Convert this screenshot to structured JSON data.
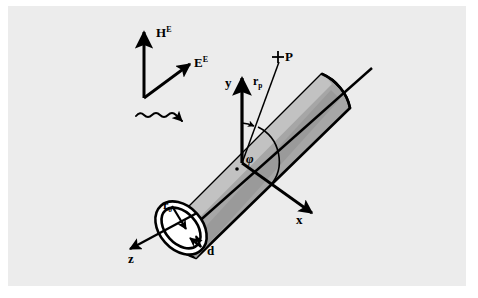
{
  "figure": {
    "background_color": "#ececec",
    "page_color": "#ffffff",
    "ink_color": "#000000",
    "cylinder_fill": "#a8a8a8",
    "cylinder_fill_light": "#c4c4c4"
  },
  "labels": {
    "h_field": "H",
    "h_field_sup": "E",
    "e_field": "E",
    "e_field_sup": "E",
    "axis_x": "x",
    "axis_y": "y",
    "axis_z": "z",
    "point_p": "P",
    "point_p_marker": "+",
    "radius_vector": "r",
    "radius_vector_sub": "p",
    "tube_radius": "r",
    "tube_radius_sub": "o",
    "wall_thickness": "d",
    "azimuth_angle": "φ"
  },
  "elements": {
    "incident_wave": "squiggly-arrow",
    "cylinder": "hollow-tube",
    "end_cap": "annulus",
    "angle_arc": "phi-arc",
    "right_angle_marker": "dot"
  }
}
